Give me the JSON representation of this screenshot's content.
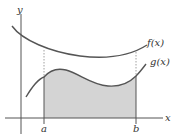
{
  "diagram": {
    "type": "area-between-curves",
    "axes": {
      "x_label": "x",
      "y_label": "y"
    },
    "curves": [
      {
        "name": "f",
        "label": "f(x)"
      },
      {
        "name": "g",
        "label": "g(x)"
      }
    ],
    "bounds": {
      "lower_label": "a",
      "upper_label": "b"
    },
    "colors": {
      "curve": "#555555",
      "axis": "#555555",
      "shade": "#d4d4d4",
      "dashed": "#888888"
    }
  }
}
